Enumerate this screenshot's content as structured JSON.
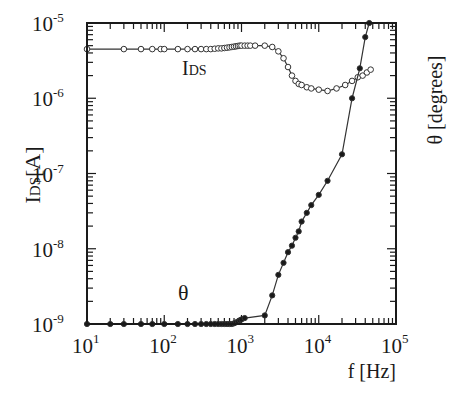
{
  "chart_data": {
    "type": "line",
    "title": "",
    "xlabel": "f [Hz]",
    "ylabel": "IDS[A]",
    "ylabel_right": "θ [degrees]",
    "xscale": "log",
    "yscale": "log",
    "xlim": [
      10,
      100000
    ],
    "ylim": [
      1e-09,
      1e-05
    ],
    "grid": false,
    "legend": "inline annotations",
    "x_ticks": [
      {
        "base": "10",
        "exp": "1"
      },
      {
        "base": "10",
        "exp": "2"
      },
      {
        "base": "10",
        "exp": "3"
      },
      {
        "base": "10",
        "exp": "4"
      },
      {
        "base": "10",
        "exp": "5"
      }
    ],
    "y_ticks": [
      {
        "base": "10",
        "exp": "-5"
      },
      {
        "base": "10",
        "exp": "-6"
      },
      {
        "base": "10",
        "exp": "-7"
      },
      {
        "base": "10",
        "exp": "-8"
      },
      {
        "base": "10",
        "exp": "-9"
      }
    ],
    "annotations": [
      {
        "text": "IDS",
        "series": "IDS"
      },
      {
        "text": "θ",
        "series": "theta"
      }
    ],
    "series": [
      {
        "name": "IDS",
        "marker": "open-circle",
        "axis": "left",
        "x": [
          10,
          30,
          50,
          70,
          90,
          100,
          150,
          200,
          250,
          300,
          350,
          400,
          450,
          500,
          550,
          600,
          650,
          700,
          750,
          800,
          850,
          900,
          950,
          1000,
          1100,
          1200,
          1300,
          1500,
          2000,
          2500,
          3000,
          3500,
          4000,
          4500,
          5000,
          5500,
          6000,
          7000,
          8000,
          10000,
          13000,
          17000,
          22000,
          27000,
          32000,
          37000,
          42000,
          47000
        ],
        "y": [
          4.5e-06,
          4.5e-06,
          4.5e-06,
          4.5e-06,
          4.5e-06,
          4.5e-06,
          4.5e-06,
          4.5e-06,
          4.5e-06,
          4.5e-06,
          4.5e-06,
          4.5e-06,
          4.55e-06,
          4.6e-06,
          4.6e-06,
          4.65e-06,
          4.7e-06,
          4.75e-06,
          4.8e-06,
          4.85e-06,
          4.9e-06,
          4.95e-06,
          5e-06,
          5e-06,
          5e-06,
          5e-06,
          5e-06,
          5e-06,
          5e-06,
          4.8e-06,
          4.2e-06,
          3.4e-06,
          2.6e-06,
          2e-06,
          1.7e-06,
          1.55e-06,
          1.5e-06,
          1.4e-06,
          1.35e-06,
          1.3e-06,
          1.25e-06,
          1.35e-06,
          1.5e-06,
          1.7e-06,
          1.9e-06,
          2e-06,
          2.2e-06,
          2.4e-06
        ]
      },
      {
        "name": "theta",
        "marker": "filled-circle",
        "axis": "right",
        "note": "right axis unlabeled; y given in left-axis-equivalent units",
        "x": [
          10,
          20,
          30,
          50,
          70,
          100,
          150,
          200,
          250,
          300,
          350,
          400,
          450,
          500,
          550,
          600,
          650,
          700,
          750,
          800,
          850,
          900,
          950,
          1000,
          1100,
          2000,
          2500,
          3000,
          3500,
          4000,
          4500,
          5000,
          5500,
          6000,
          7000,
          8000,
          10000,
          13000,
          20000,
          27000,
          34000,
          40000,
          45000
        ],
        "y": [
          1e-09,
          1e-09,
          1e-09,
          1e-09,
          1e-09,
          1e-09,
          1e-09,
          1e-09,
          1e-09,
          1e-09,
          1e-09,
          1e-09,
          1e-09,
          1e-09,
          1e-09,
          1e-09,
          1e-09,
          1e-09,
          1e-09,
          1.02e-09,
          1.05e-09,
          1.08e-09,
          1.12e-09,
          1.15e-09,
          1.2e-09,
          1.3e-09,
          2.4e-09,
          4.5e-09,
          6.5e-09,
          9e-09,
          1.1e-08,
          1.4e-08,
          1.7e-08,
          2.3e-08,
          3e-08,
          3.8e-08,
          5.2e-08,
          8e-08,
          1.8e-07,
          1e-06,
          2.5e-06,
          6.5e-06,
          1e-05
        ]
      }
    ]
  }
}
